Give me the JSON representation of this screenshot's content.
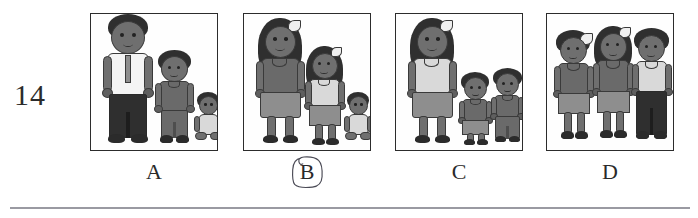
{
  "worksheet": {
    "question_number": "14",
    "rule_visible": true
  },
  "marking": {
    "selected_option": "B",
    "mark_type": "hand-drawn-pen-circle"
  },
  "options": [
    {
      "id": "A",
      "label": "A",
      "selected": false,
      "figures": [
        {
          "role": "adult-man",
          "height_rank": "tallest",
          "top": "white-shirt-with-tie",
          "bottom": "dark-trousers",
          "pose": "standing"
        },
        {
          "role": "child-boy",
          "height_rank": "medium",
          "top": "grey-t-shirt",
          "bottom": "grey-trousers",
          "pose": "standing"
        },
        {
          "role": "baby",
          "height_rank": "shortest",
          "top": "light-onesie",
          "bottom": "light-onesie",
          "pose": "sitting"
        }
      ]
    },
    {
      "id": "B",
      "label": "B",
      "selected": true,
      "figures": [
        {
          "role": "adult-woman",
          "height_rank": "tallest",
          "top": "dark-grey-top",
          "bottom": "grey-skirt",
          "pose": "standing"
        },
        {
          "role": "child-girl",
          "height_rank": "medium",
          "top": "light-top",
          "bottom": "grey-skirt",
          "pose": "standing"
        },
        {
          "role": "baby",
          "height_rank": "shortest",
          "top": "light-onesie",
          "bottom": "light-onesie",
          "pose": "sitting"
        }
      ]
    },
    {
      "id": "C",
      "label": "C",
      "selected": false,
      "figures": [
        {
          "role": "adult-woman",
          "height_rank": "tallest",
          "top": "light-top",
          "bottom": "grey-skirt",
          "pose": "standing"
        },
        {
          "role": "child-girl",
          "height_rank": "short",
          "top": "grey-top",
          "bottom": "grey-skirt",
          "pose": "standing"
        },
        {
          "role": "child-boy",
          "height_rank": "short",
          "top": "grey-t-shirt",
          "bottom": "grey-trousers",
          "pose": "standing"
        }
      ]
    },
    {
      "id": "D",
      "label": "D",
      "selected": false,
      "figures": [
        {
          "role": "child-girl",
          "height_rank": "equal",
          "top": "grey-top",
          "bottom": "grey-skirt",
          "pose": "standing-holding-hands"
        },
        {
          "role": "child-girl",
          "height_rank": "equal",
          "top": "grey-top",
          "bottom": "grey-skirt",
          "pose": "standing-holding-hands"
        },
        {
          "role": "child-boy",
          "height_rank": "equal",
          "top": "light-t-shirt",
          "bottom": "dark-trousers",
          "pose": "standing-holding-hands"
        }
      ]
    }
  ],
  "colors": {
    "skin": "#6f6f6f",
    "hair": "#2f2f2f",
    "outline": "#3a3a3a",
    "shirt_light": "#d9d9d9",
    "shirt_white": "#f4f4f4",
    "shirt_dark": "#6a6a6a",
    "skirt": "#8e8e8e",
    "pants_dark": "#2f2f2f",
    "panel_border": "#2c2c2c",
    "text": "#2a2a2a",
    "pen_mark": "#4a4a55",
    "rule": "#9a9aa2",
    "background": "#ffffff"
  }
}
